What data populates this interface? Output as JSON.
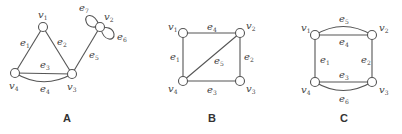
{
  "graphs": [
    {
      "caption": "A",
      "vertices": [
        {
          "id": "v1",
          "base": "v",
          "sub": "1"
        },
        {
          "id": "v2",
          "base": "v",
          "sub": "2"
        },
        {
          "id": "v3",
          "base": "v",
          "sub": "3"
        },
        {
          "id": "v4",
          "base": "v",
          "sub": "4"
        }
      ],
      "edges": [
        {
          "id": "e1",
          "base": "e",
          "sub": "1",
          "from": "v1",
          "to": "v4"
        },
        {
          "id": "e2",
          "base": "e",
          "sub": "2",
          "from": "v1",
          "to": "v3"
        },
        {
          "id": "e3",
          "base": "e",
          "sub": "3",
          "from": "v4",
          "to": "v3"
        },
        {
          "id": "e4",
          "base": "e",
          "sub": "4",
          "from": "v4",
          "to": "v3"
        },
        {
          "id": "e5",
          "base": "e",
          "sub": "5",
          "from": "v3",
          "to": "v2"
        },
        {
          "id": "e6",
          "base": "e",
          "sub": "6",
          "from": "v2",
          "to": "v2"
        },
        {
          "id": "e7",
          "base": "e",
          "sub": "7",
          "from": "v2",
          "to": "v2"
        }
      ]
    },
    {
      "caption": "B",
      "vertices": [
        {
          "id": "v1",
          "base": "v",
          "sub": "1"
        },
        {
          "id": "v2",
          "base": "v",
          "sub": "2"
        },
        {
          "id": "v3",
          "base": "v",
          "sub": "3"
        },
        {
          "id": "v4",
          "base": "v",
          "sub": "4"
        }
      ],
      "edges": [
        {
          "id": "e1",
          "base": "e",
          "sub": "1",
          "from": "v1",
          "to": "v4"
        },
        {
          "id": "e2",
          "base": "e",
          "sub": "2",
          "from": "v2",
          "to": "v3"
        },
        {
          "id": "e3",
          "base": "e",
          "sub": "3",
          "from": "v4",
          "to": "v3"
        },
        {
          "id": "e4",
          "base": "e",
          "sub": "4",
          "from": "v1",
          "to": "v2"
        },
        {
          "id": "e5",
          "base": "e",
          "sub": "5",
          "from": "v4",
          "to": "v2"
        }
      ]
    },
    {
      "caption": "C",
      "vertices": [
        {
          "id": "v1",
          "base": "v",
          "sub": "1"
        },
        {
          "id": "v2",
          "base": "v",
          "sub": "2"
        },
        {
          "id": "v3",
          "base": "v",
          "sub": "3"
        },
        {
          "id": "v4",
          "base": "v",
          "sub": "4"
        }
      ],
      "edges": [
        {
          "id": "e1",
          "base": "e",
          "sub": "1",
          "from": "v1",
          "to": "v4"
        },
        {
          "id": "e2",
          "base": "e",
          "sub": "2",
          "from": "v2",
          "to": "v3"
        },
        {
          "id": "e3",
          "base": "e",
          "sub": "3",
          "from": "v4",
          "to": "v3"
        },
        {
          "id": "e4",
          "base": "e",
          "sub": "4",
          "from": "v1",
          "to": "v2"
        },
        {
          "id": "e5",
          "base": "e",
          "sub": "5",
          "from": "v1",
          "to": "v2"
        },
        {
          "id": "e6",
          "base": "e",
          "sub": "6",
          "from": "v4",
          "to": "v3"
        }
      ]
    }
  ]
}
